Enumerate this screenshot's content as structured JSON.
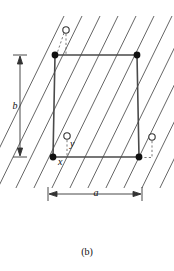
{
  "figure": {
    "caption": "(b)",
    "labels": {
      "lattice_param_a": "a",
      "lattice_param_b": "b",
      "axis_x": "x",
      "axis_y": "y"
    },
    "colors": {
      "stroke": "#3a3a3a",
      "hatch": "#555555",
      "dashed": "#6a6a6a",
      "atom_fill": "#111111",
      "atom_open_fill": "#ffffff",
      "text": "#111111",
      "background": "#ffffff"
    },
    "cell": {
      "shape": "parallelogram",
      "corners": [
        {
          "name": "top-left",
          "x": 55,
          "y": 55
        },
        {
          "name": "top-right",
          "x": 137,
          "y": 55
        },
        {
          "name": "bottom-right",
          "x": 139,
          "y": 157
        },
        {
          "name": "bottom-left",
          "x": 53,
          "y": 157
        }
      ],
      "corner_atom_radius": 3.4
    },
    "open_atoms": [
      {
        "name": "open-atom-top",
        "x": 66,
        "y": 30,
        "r": 3.2
      },
      {
        "name": "open-atom-mid-left",
        "x": 67,
        "y": 136,
        "r": 3.2
      },
      {
        "name": "open-atom-right",
        "x": 152,
        "y": 137,
        "r": 3.2
      }
    ],
    "dashed_connectors": [
      {
        "name": "dashed-top-vertical",
        "x1": 66,
        "y1": 34,
        "x2": 66,
        "y2": 55
      },
      {
        "name": "dashed-top-diagonal",
        "x1": 64,
        "y1": 33,
        "x2": 56,
        "y2": 56
      },
      {
        "name": "dashed-y-axis",
        "x1": 67,
        "y1": 140,
        "x2": 67,
        "y2": 158
      },
      {
        "name": "dashed-right-vertical",
        "x1": 152,
        "y1": 141,
        "x2": 152,
        "y2": 158
      },
      {
        "name": "dashed-right-horizontal",
        "x1": 140,
        "y1": 158,
        "x2": 152,
        "y2": 158
      }
    ],
    "hatch_lines": {
      "count": 11,
      "angle_deg": 63,
      "spacing_px": 18,
      "description": "parallel slip-plane traces running lower-left to upper-right"
    },
    "dimension_b": {
      "orientation": "vertical",
      "line_x": 20,
      "y_top": 55,
      "y_bottom": 157,
      "tick_half_width": 7
    },
    "dimension_a": {
      "orientation": "horizontal",
      "line_y": 194,
      "x_left": 48,
      "x_right": 142,
      "tick_half_height": 7
    }
  }
}
